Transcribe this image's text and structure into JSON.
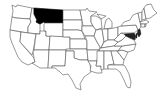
{
  "map": {
    "type": "choropleth",
    "region": "United States",
    "highlighted_states": [
      "Montana"
    ],
    "colors": {
      "highlight": "#000000",
      "default": "#ffffff",
      "border": "#555555"
    }
  }
}
